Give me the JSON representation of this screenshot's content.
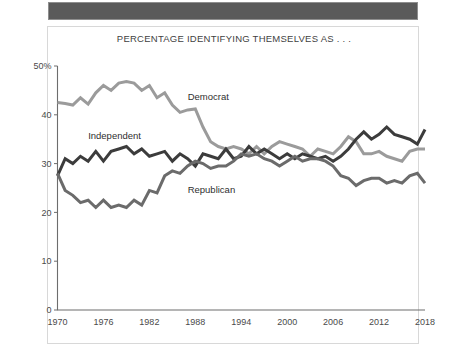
{
  "banner": {
    "name": "top-dark-banner"
  },
  "chart_data": {
    "type": "line",
    "title": "PERCENTAGE IDENTIFYING THEMSELVES AS . . .",
    "xlabel": "",
    "ylabel": "",
    "xlim": [
      1970,
      2018
    ],
    "ylim": [
      0,
      50
    ],
    "grid": false,
    "legend_position": "inline-annotations",
    "ytick_labels": [
      "0",
      "10",
      "20",
      "30",
      "40",
      "50%"
    ],
    "ytick_values": [
      0,
      10,
      20,
      30,
      40,
      50
    ],
    "xtick_labels": [
      "1970",
      "1976",
      "1982",
      "1988",
      "1994",
      "2000",
      "2006",
      "2012",
      "2018"
    ],
    "xtick_values": [
      1970,
      1976,
      1982,
      1988,
      1994,
      2000,
      2006,
      2012,
      2018
    ],
    "x": [
      1970,
      1971,
      1972,
      1973,
      1974,
      1975,
      1976,
      1977,
      1978,
      1979,
      1980,
      1981,
      1982,
      1983,
      1984,
      1985,
      1986,
      1987,
      1988,
      1989,
      1990,
      1991,
      1992,
      1993,
      1994,
      1995,
      1996,
      1997,
      1998,
      1999,
      2000,
      2001,
      2002,
      2003,
      2004,
      2005,
      2006,
      2007,
      2008,
      2009,
      2010,
      2011,
      2012,
      2013,
      2014,
      2015,
      2016,
      2017,
      2018
    ],
    "series": [
      {
        "name": "Democrat",
        "color": "#9b9b9b",
        "label_x": 1987,
        "label_y": 43,
        "values": [
          42.5,
          42.3,
          42.0,
          43.5,
          42.2,
          44.5,
          46.0,
          45.0,
          46.5,
          46.8,
          46.5,
          45.0,
          46.0,
          43.5,
          44.5,
          42.0,
          40.5,
          41.0,
          41.2,
          37.5,
          34.5,
          33.5,
          33.0,
          33.5,
          33.0,
          32.0,
          33.5,
          32.0,
          33.5,
          34.5,
          34.0,
          33.5,
          33.0,
          31.5,
          33.0,
          32.5,
          32.0,
          33.5,
          35.5,
          34.5,
          32.0,
          32.0,
          32.5,
          31.5,
          31.0,
          30.5,
          32.5,
          33.0,
          33.0
        ]
      },
      {
        "name": "Independent",
        "color": "#3c3c3c",
        "label_x": 1974,
        "label_y": 35,
        "values": [
          27.5,
          31.0,
          30.0,
          31.5,
          30.5,
          32.5,
          30.5,
          32.5,
          33.0,
          33.5,
          32.0,
          33.0,
          31.5,
          32.0,
          32.5,
          30.5,
          32.0,
          31.0,
          29.5,
          32.0,
          31.5,
          31.0,
          33.0,
          31.0,
          31.5,
          33.5,
          32.0,
          33.0,
          32.0,
          31.0,
          32.0,
          31.0,
          32.0,
          31.5,
          31.0,
          31.5,
          30.5,
          31.5,
          33.0,
          35.0,
          36.5,
          35.0,
          36.0,
          37.5,
          36.0,
          35.5,
          35.0,
          34.0,
          37.0
        ]
      },
      {
        "name": "Republican",
        "color": "#6b6b6b",
        "label_x": 1987,
        "label_y": 24,
        "values": [
          28.0,
          24.5,
          23.5,
          22.0,
          22.5,
          21.0,
          22.5,
          21.0,
          21.5,
          21.0,
          22.5,
          21.5,
          24.5,
          24.0,
          27.5,
          28.5,
          28.0,
          29.5,
          30.5,
          30.0,
          29.0,
          29.5,
          29.5,
          30.5,
          32.0,
          31.5,
          32.0,
          31.0,
          30.5,
          29.5,
          30.5,
          31.5,
          30.5,
          31.0,
          31.0,
          30.5,
          29.5,
          27.5,
          27.0,
          25.5,
          26.5,
          27.0,
          27.0,
          26.0,
          26.5,
          26.0,
          27.5,
          28.0,
          26.0
        ]
      }
    ]
  }
}
